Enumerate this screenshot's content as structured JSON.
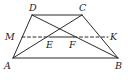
{
  "figure": {
    "type": "trapezoid",
    "points": {
      "A": {
        "label": "A",
        "x": 13,
        "y": 58,
        "lx": 4,
        "ly": 69
      },
      "B": {
        "label": "B",
        "x": 118,
        "y": 58,
        "lx": 115,
        "ly": 69
      },
      "C": {
        "label": "C",
        "x": 82,
        "y": 15,
        "lx": 79,
        "ly": 11
      },
      "D": {
        "label": "D",
        "x": 32,
        "y": 15,
        "lx": 29,
        "ly": 11
      },
      "M": {
        "label": "M",
        "x": 22,
        "y": 37,
        "lx": 5,
        "ly": 40
      },
      "K": {
        "label": "K",
        "x": 108,
        "y": 37,
        "lx": 110,
        "ly": 40
      },
      "E": {
        "label": "E",
        "x": 49,
        "y": 37,
        "lx": 46,
        "ly": 48
      },
      "F": {
        "label": "F",
        "x": 74,
        "y": 37,
        "lx": 69,
        "ly": 48
      }
    },
    "segments": [
      {
        "from": "A",
        "to": "B",
        "style": "solid"
      },
      {
        "from": "D",
        "to": "C",
        "style": "solid"
      },
      {
        "from": "A",
        "to": "D",
        "style": "solid"
      },
      {
        "from": "B",
        "to": "C",
        "style": "solid"
      },
      {
        "from": "A",
        "to": "C",
        "style": "solid"
      },
      {
        "from": "B",
        "to": "D",
        "style": "solid"
      },
      {
        "from": "M",
        "to": "E",
        "style": "dashed"
      },
      {
        "from": "E",
        "to": "F",
        "style": "solid"
      },
      {
        "from": "F",
        "to": "K",
        "style": "dashed"
      }
    ],
    "colors": {
      "line": "#2a2a2a",
      "label": "#1e1e1e",
      "background": "#ffffff"
    }
  }
}
